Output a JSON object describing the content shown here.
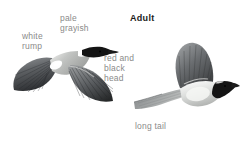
{
  "plate": {
    "background_color": "#ffffff",
    "width": 249,
    "height": 144,
    "style": "field-guide bird identification plate, grayscale"
  },
  "heading": {
    "adult": "Adult"
  },
  "annotations": [
    {
      "id": "pale-grayish",
      "text": "pale\ngrayish",
      "color": "#8a8a8a"
    },
    {
      "id": "white-rump",
      "text": "white\nrump",
      "color": "#8a8a8a"
    },
    {
      "id": "red-black-head",
      "text": "red and\nblack\nhead",
      "color": "#8a8a8a"
    },
    {
      "id": "long-tail",
      "text": "long tail",
      "color": "#8a8a8a"
    }
  ],
  "figures": [
    {
      "id": "bird-flying-dorsal",
      "name": "bird-flying-dorsal",
      "description": "bird in flight viewed from above with both wings spread",
      "head_color": "#141414",
      "body_color": "#b9bbb9",
      "wing_color": "#5d6063",
      "rump_color": "#fbfbfb"
    },
    {
      "id": "bird-flying-side",
      "name": "bird-flying-side",
      "description": "bird in flight side profile with raised wing and long tail",
      "head_color": "#141414",
      "body_color": "#d2d4d2",
      "wing_color": "#6a6d70",
      "tail_color": "#9b9e9f"
    }
  ],
  "palette": {
    "label_gray": "#8a8a8a",
    "heading_black": "#1b1b1b",
    "dark_plumage": "#141414",
    "mid_plumage": "#6a6d70",
    "pale_plumage": "#cfd1cf",
    "white": "#ffffff"
  }
}
